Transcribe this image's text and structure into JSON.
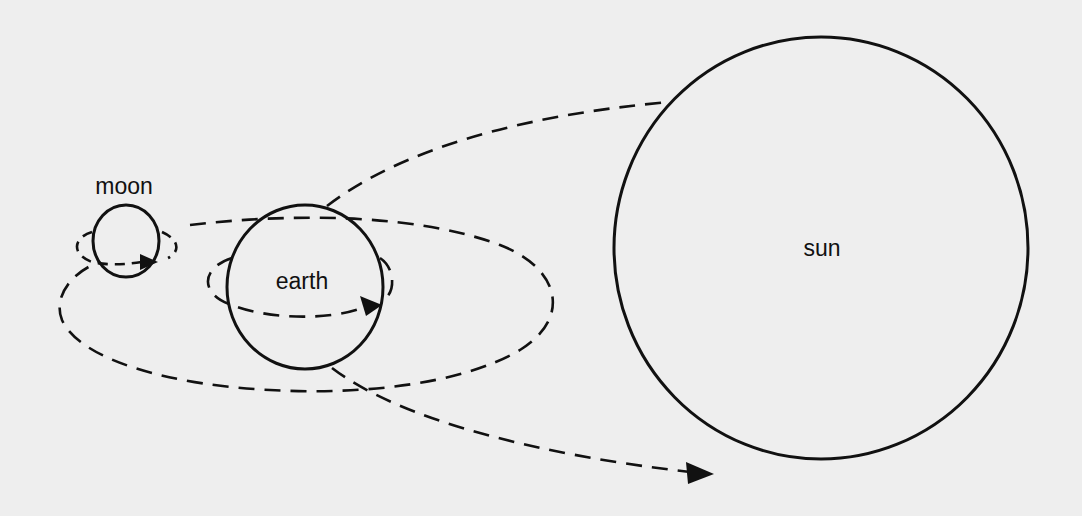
{
  "diagram": {
    "title": "",
    "background_color": "#eeeeee",
    "stroke_color": "#111111",
    "bodies": [
      {
        "id": "moon",
        "label": "moon",
        "cx": 126,
        "cy": 241,
        "rx": 33,
        "ry": 36,
        "label_x": 124,
        "label_y": 186
      },
      {
        "id": "earth",
        "label": "earth",
        "cx": 305,
        "cy": 287,
        "rx": 78,
        "ry": 82,
        "label_x": 302,
        "label_y": 281
      },
      {
        "id": "sun",
        "label": "sun",
        "cx": 821,
        "cy": 248,
        "rx": 207,
        "ry": 211,
        "label_x": 822,
        "label_y": 248
      }
    ],
    "paths": [
      {
        "id": "moon-spin",
        "description": "moon rotation arrow"
      },
      {
        "id": "earth-spin",
        "description": "earth rotation arrow"
      },
      {
        "id": "moon-orbit",
        "description": "moon orbit around earth"
      },
      {
        "id": "earth-orbit",
        "description": "earth orbit toward sun (arrow)"
      },
      {
        "id": "sun-tangent",
        "description": "tangent line from earth to sun"
      }
    ]
  }
}
